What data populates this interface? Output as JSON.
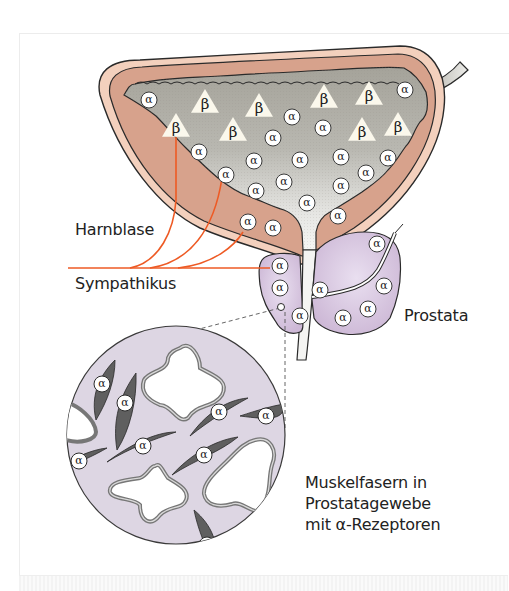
{
  "labels": {
    "bladder": "Harnblase",
    "nerve": "Sympathikus",
    "prostate": "Prostata",
    "inset_caption": [
      "Muskelfasern in",
      "Prostatagewebe",
      "mit α-Rezeptoren"
    ]
  },
  "receptors": {
    "alpha_symbol": "α",
    "beta_symbol": "β"
  },
  "colors": {
    "bladder_outer_wall": "#f2cdb8",
    "bladder_muscle_layer": "#d8a48e",
    "bladder_lumen_top": "#a7a59c",
    "bladder_lumen_bottom": "#f4f4f2",
    "prostate": "#d6c3dc",
    "nerve": "#ee5a24",
    "inset_background": "#ddd6e3",
    "muscle_fiber": "#5f5f5f",
    "outline": "#2a2a2a"
  },
  "bladder": {
    "beta_receptors": [
      {
        "x": 205,
        "y": 103
      },
      {
        "x": 259,
        "y": 107
      },
      {
        "x": 324,
        "y": 98
      },
      {
        "x": 369,
        "y": 95
      },
      {
        "x": 176,
        "y": 127
      },
      {
        "x": 233,
        "y": 131
      },
      {
        "x": 362,
        "y": 131
      },
      {
        "x": 398,
        "y": 126
      }
    ],
    "alpha_receptors": [
      {
        "x": 149,
        "y": 100
      },
      {
        "x": 405,
        "y": 90
      },
      {
        "x": 292,
        "y": 117
      },
      {
        "x": 273,
        "y": 138
      },
      {
        "x": 323,
        "y": 128
      },
      {
        "x": 199,
        "y": 152
      },
      {
        "x": 254,
        "y": 161
      },
      {
        "x": 300,
        "y": 160
      },
      {
        "x": 341,
        "y": 157
      },
      {
        "x": 388,
        "y": 158
      },
      {
        "x": 226,
        "y": 175
      },
      {
        "x": 284,
        "y": 182
      },
      {
        "x": 366,
        "y": 173
      },
      {
        "x": 256,
        "y": 191
      },
      {
        "x": 341,
        "y": 186
      },
      {
        "x": 307,
        "y": 203
      },
      {
        "x": 338,
        "y": 216
      },
      {
        "x": 248,
        "y": 222
      },
      {
        "x": 273,
        "y": 228
      }
    ]
  },
  "prostate": {
    "alpha_receptors": [
      {
        "x": 280,
        "y": 266
      },
      {
        "x": 280,
        "y": 288
      },
      {
        "x": 320,
        "y": 290
      },
      {
        "x": 300,
        "y": 316
      },
      {
        "x": 377,
        "y": 244
      },
      {
        "x": 384,
        "y": 286
      },
      {
        "x": 368,
        "y": 309
      },
      {
        "x": 343,
        "y": 318
      }
    ]
  },
  "inset": {
    "alpha_receptors": [
      {
        "x": 102,
        "y": 384
      },
      {
        "x": 125,
        "y": 403
      },
      {
        "x": 79,
        "y": 461
      },
      {
        "x": 143,
        "y": 446
      },
      {
        "x": 219,
        "y": 412
      },
      {
        "x": 204,
        "y": 455
      },
      {
        "x": 266,
        "y": 416
      },
      {
        "x": 207,
        "y": 545
      }
    ]
  }
}
